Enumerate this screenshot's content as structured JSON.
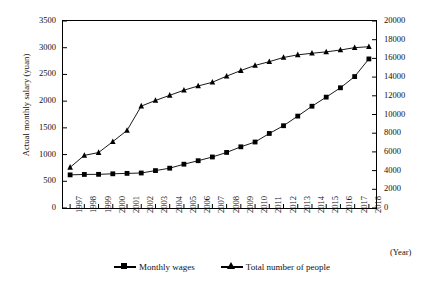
{
  "chart_data": {
    "type": "line",
    "title": "",
    "xlabel": "(Year)",
    "ylabel_left": "Actual monthly salary (yuan)",
    "ylabel_right": "Number of people in stock (ten thousand people)",
    "categories": [
      "1997",
      "1998",
      "1999",
      "2000",
      "2001",
      "2002",
      "2003",
      "2004",
      "2005",
      "2006",
      "2007",
      "2008",
      "2009",
      "2010",
      "2011",
      "2012",
      "2013",
      "2014",
      "2015",
      "2016",
      "2017",
      "2018"
    ],
    "ylim_left": [
      0,
      3500
    ],
    "ytick_step_left": 500,
    "yticks_left": [
      "0",
      "500",
      "1000",
      "1500",
      "2000",
      "2500",
      "3000",
      "3500"
    ],
    "ylim_right": [
      0,
      20000
    ],
    "ytick_step_right": 2000,
    "yticks_right": [
      "0",
      "2000",
      "4000",
      "6000",
      "8000",
      "10000",
      "12000",
      "14000",
      "16000",
      "18000",
      "20000"
    ],
    "grid": false,
    "legend_position": "bottom",
    "series": [
      {
        "name": "Monthly wages",
        "axis": "left",
        "marker": "square",
        "unit": "yuan",
        "values": [
          620,
          628,
          630,
          640,
          648,
          655,
          700,
          745,
          820,
          885,
          955,
          1040,
          1145,
          1235,
          1395,
          1540,
          1720,
          1905,
          2075,
          2250,
          2460,
          2790
        ]
      },
      {
        "name": "Total number of people",
        "axis": "right",
        "marker": "triangle",
        "unit": "ten thousand people",
        "values": [
          4350,
          5630,
          5930,
          7100,
          8300,
          10900,
          11500,
          12050,
          12600,
          13050,
          13450,
          14100,
          14700,
          15250,
          15650,
          16100,
          16380,
          16550,
          16700,
          16900,
          17150,
          17250
        ]
      }
    ]
  },
  "legend": {
    "items": [
      {
        "label": "Monthly wages",
        "marker": "square"
      },
      {
        "label": "Total number of people",
        "marker": "triangle"
      }
    ]
  },
  "axes": {
    "x_unit_label": "(Year)"
  },
  "colors": {
    "line": "#000000",
    "marker": "#000000",
    "axis": "#000000",
    "background": "#ffffff"
  }
}
